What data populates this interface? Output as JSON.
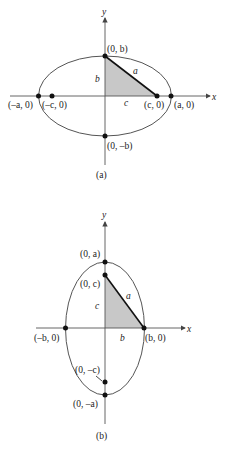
{
  "figures": [
    {
      "id": "a",
      "caption": "(a)",
      "x_axis_label": "x",
      "y_axis_label": "y",
      "points": [
        {
          "name": "top-vertex",
          "label": "(0, b)"
        },
        {
          "name": "bottom-vertex",
          "label": "(0, –b)"
        },
        {
          "name": "left-vertex",
          "label": "(–a, 0)"
        },
        {
          "name": "left-focus",
          "label": "(–c, 0)"
        },
        {
          "name": "right-focus",
          "label": "(c, 0)"
        },
        {
          "name": "right-vertex",
          "label": "(a, 0)"
        }
      ],
      "triangle_labels": {
        "vertical": "b",
        "horizontal": "c",
        "hypotenuse": "a"
      }
    },
    {
      "id": "b",
      "caption": "(b)",
      "x_axis_label": "x",
      "y_axis_label": "y",
      "points": [
        {
          "name": "top-vertex",
          "label": "(0, a)"
        },
        {
          "name": "top-focus",
          "label": "(0, c)"
        },
        {
          "name": "left-vertex",
          "label": "(–b, 0)"
        },
        {
          "name": "right-vertex",
          "label": "(b, 0)"
        },
        {
          "name": "bottom-focus",
          "label": "(0, –c)"
        },
        {
          "name": "bottom-vertex",
          "label": "(0, –a)"
        }
      ],
      "triangle_labels": {
        "vertical": "c",
        "horizontal": "b",
        "hypotenuse": "a"
      }
    }
  ],
  "colors": {
    "line": "#444444",
    "fill": "#c8c8c8",
    "point": "#111111"
  }
}
